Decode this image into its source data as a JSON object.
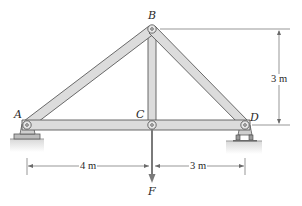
{
  "figure": {
    "type": "truss",
    "joints": {
      "A": {
        "label": "A"
      },
      "B": {
        "label": "B"
      },
      "C": {
        "label": "C"
      },
      "D": {
        "label": "D"
      }
    },
    "members": [
      "AB",
      "BC",
      "BD",
      "AC",
      "CD"
    ],
    "supports": {
      "A": "pin",
      "D": "roller"
    },
    "load": {
      "label": "F",
      "at": "C",
      "direction": "down"
    },
    "dimensions": {
      "height": "3 m",
      "span_left": "4 m",
      "span_right": "3 m"
    }
  },
  "colors": {
    "member_fill": "#dcdcdc",
    "member_stroke": "#5a5a5a",
    "ground": "#e4e4e4",
    "dim_line": "#6a6a6a",
    "load_arrow": "#7a7a7a"
  }
}
